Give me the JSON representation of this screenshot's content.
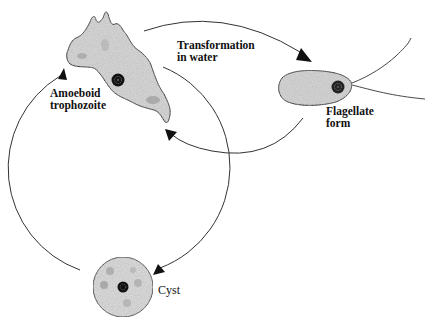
{
  "diagram": {
    "type": "life-cycle",
    "colors": {
      "line": "#333333",
      "arrow": "#111111",
      "cell_fill": "#d8d8d8",
      "cell_stroke": "#222222",
      "nucleus": "#111111"
    },
    "stages": [
      {
        "id": "amoeboid",
        "line1": "Amoeboid",
        "line2": "trophozoite"
      },
      {
        "id": "flagellate",
        "line1": "Flagellate",
        "line2": "form"
      },
      {
        "id": "cyst",
        "line1": "Cyst"
      }
    ],
    "transitions": [
      {
        "from": "amoeboid",
        "to": "flagellate",
        "line1": "Transformation",
        "line2": "in water"
      },
      {
        "from": "flagellate",
        "to": "amoeboid",
        "label": ""
      },
      {
        "from": "amoeboid",
        "to": "cyst",
        "label": ""
      },
      {
        "from": "cyst",
        "to": "amoeboid",
        "label": ""
      }
    ]
  }
}
